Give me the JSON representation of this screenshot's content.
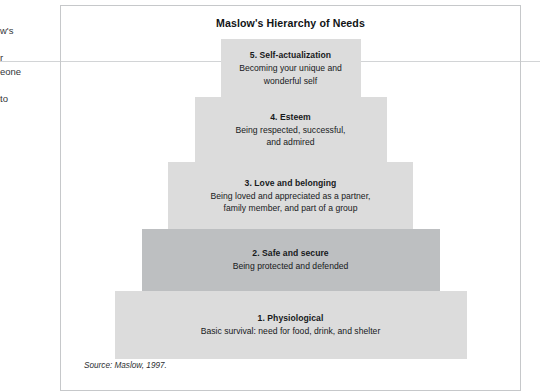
{
  "page": {
    "background_color": "#ffffff",
    "margin_text_lines": [
      "w's",
      "",
      "r",
      "eone",
      "",
      "to"
    ],
    "rule_color": "#d2d4d6"
  },
  "figure": {
    "title": "Maslow's Hierarchy of Needs",
    "border_color": "#c6c8ca",
    "source": "Source: Maslow, 1997."
  },
  "chart_data": {
    "type": "pyramid",
    "title": "Maslow's Hierarchy of Needs",
    "xlabel": "",
    "ylabel": "",
    "legend_position": "none",
    "grid": false,
    "note": "Five-level Maslow pyramid, level 1 at the base (widest) through level 5 at the apex (narrowest). Widths increase monotonically from apex to base.",
    "levels": [
      {
        "level": 5,
        "title": "5. Self-actualization",
        "description": "Becoming your unique and wonderful self",
        "description_lines": [
          "Becoming your unique and",
          "wonderful self"
        ],
        "width_px": 140,
        "height_px": 58,
        "fill_color": "#dcdcdc"
      },
      {
        "level": 4,
        "title": "4. Esteem",
        "description": "Being respected, successful, and admired",
        "description_lines": [
          "Being respected, successful,",
          "and admired"
        ],
        "width_px": 192,
        "height_px": 65,
        "fill_color": "#dcdcdc"
      },
      {
        "level": 3,
        "title": "3. Love and belonging",
        "description": "Being loved and appreciated as a partner, family member, and part of a group",
        "description_lines": [
          "Being loved and appreciated as a partner,",
          "family member, and part of a group"
        ],
        "width_px": 245,
        "height_px": 67,
        "fill_color": "#dcdcdc"
      },
      {
        "level": 2,
        "title": "2. Safe and secure",
        "description": "Being protected and defended",
        "description_lines": [
          "Being protected and defended"
        ],
        "width_px": 298,
        "height_px": 62,
        "fill_color": "#bdbfc1"
      },
      {
        "level": 1,
        "title": "1. Physiological",
        "description": "Basic survival: need for food, drink, and shelter",
        "description_lines": [
          "Basic survival: need for food, drink, and shelter"
        ],
        "width_px": 352,
        "height_px": 68,
        "fill_color": "#dcdcdc"
      }
    ]
  }
}
